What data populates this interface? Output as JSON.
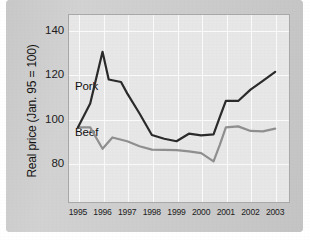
{
  "figure": {
    "background_color": "#cfcfcf",
    "panel_color": "#e7e7e7",
    "grid_color": "#fbfbfb",
    "frame_color": "#a9a9a9"
  },
  "chart_data": {
    "type": "line",
    "title": "",
    "xlabel": "",
    "ylabel": "Real price (Jan. 95 = 100)",
    "x": [
      1995,
      1996,
      1997,
      1998,
      1999,
      2000,
      2001,
      2002,
      2003
    ],
    "xticklabels": [
      "1995",
      "1996",
      "1997",
      "1998",
      "1999",
      "2000",
      "2001",
      "2002",
      "2003"
    ],
    "yticks": [
      80,
      100,
      120,
      140
    ],
    "yticklabels": [
      "80",
      "100",
      "120",
      "140"
    ],
    "ylim": [
      70,
      145
    ],
    "xlim": [
      1994.6,
      2003.6
    ],
    "grid": true,
    "legend_position": "in-plot annotations",
    "series": [
      {
        "name": "Pork",
        "color": "#2b2b2b",
        "linewidth": 2.0,
        "label_color": "#111111",
        "x": [
          1995.0,
          1995.5,
          1996.0,
          1996.25,
          1996.75,
          1997.0,
          1997.5,
          1998.0,
          1998.5,
          1999.0,
          1999.5,
          2000.0,
          2000.5,
          2000.75,
          2001.0,
          2001.5,
          2002.0,
          2002.5,
          2003.0
        ],
        "values": [
          100.0,
          109.5,
          130.0,
          119.0,
          118.0,
          113.5,
          105.5,
          97.0,
          95.5,
          94.5,
          97.5,
          96.8,
          97.2,
          104.0,
          110.5,
          110.5,
          115.0,
          118.5,
          122.0
        ]
      },
      {
        "name": "Beef",
        "color": "#8f8f8f",
        "linewidth": 2.0,
        "label_color": "#111111",
        "x": [
          1995.0,
          1995.5,
          1996.0,
          1996.4,
          1997.0,
          1997.5,
          1998.0,
          1999.0,
          1999.5,
          2000.0,
          2000.5,
          2000.75,
          2001.0,
          2001.5,
          2002.0,
          2002.5,
          2003.0
        ],
        "values": [
          100.0,
          100.0,
          91.5,
          96.0,
          94.5,
          92.5,
          91.2,
          91.0,
          90.5,
          89.8,
          86.5,
          93.0,
          100.0,
          100.4,
          98.6,
          98.4,
          99.5
        ]
      }
    ],
    "annotations": [
      {
        "text": "Pork",
        "x": 1995.1,
        "y": 113.5
      },
      {
        "text": "Beef",
        "x": 1995.1,
        "y": 93.0
      }
    ]
  }
}
